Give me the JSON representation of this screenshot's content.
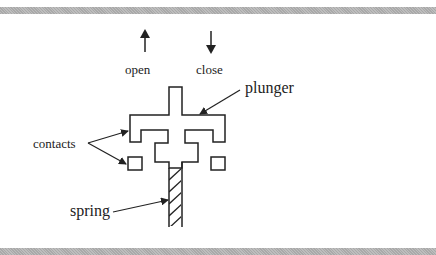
{
  "diagram": {
    "labels": {
      "open": "open",
      "close": "close",
      "plunger": "plunger",
      "contacts": "contacts",
      "spring": "spring"
    },
    "colors": {
      "stroke": "#222222",
      "band": "#b3b3b3",
      "background": "#ffffff"
    }
  }
}
